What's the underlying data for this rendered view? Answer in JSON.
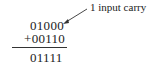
{
  "annotation": {
    "label": "1 input carry"
  },
  "addition": {
    "operand1": "01000",
    "operand2": "+00110",
    "result": "01111"
  }
}
